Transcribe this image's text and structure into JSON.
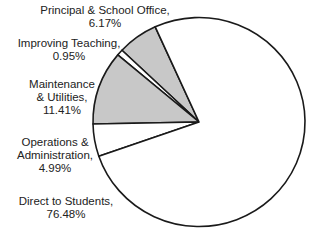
{
  "chart_data": {
    "type": "pie",
    "title": "",
    "start_angle_deg": 335.6,
    "direction": "counterclockwise",
    "slices": [
      {
        "label": "Principal & School Office",
        "value": 6.17,
        "display": "6.17%",
        "fill": "#c8c8c8"
      },
      {
        "label": "Improving Teaching",
        "value": 0.95,
        "display": "0.95%",
        "fill": "#ffffff"
      },
      {
        "label": "Maintenance & Utilities",
        "value": 11.41,
        "display": "11.41%",
        "fill": "#c8c8c8"
      },
      {
        "label": "Operations & Administration",
        "value": 4.99,
        "display": "4.99%",
        "fill": "#ffffff"
      },
      {
        "label": "Direct to Students",
        "value": 76.48,
        "display": "76.48%",
        "fill": "#ffffff"
      }
    ]
  },
  "labels": {
    "principal": {
      "line1": "Principal & School Office,",
      "line2": "6.17%"
    },
    "improving": {
      "line1": "Improving Teaching,",
      "line2": "0.95%"
    },
    "maintenance": {
      "line1": "Maintenance",
      "line2": "& Utilities,",
      "line3": "11.41%"
    },
    "operations": {
      "line1": "Operations &",
      "line2": "Administration,",
      "line3": "4.99%"
    },
    "direct": {
      "line1": "Direct to Students,",
      "line2": "76.48%"
    }
  },
  "colors": {
    "stroke": "#1a1a1a",
    "grey_fill": "#c8c8c8"
  }
}
